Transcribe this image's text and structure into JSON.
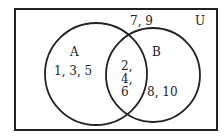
{
  "universe": {
    "label": "U",
    "outside_elements": "7, 9"
  },
  "sets": [
    {
      "name": "A",
      "only_elements": "1, 3, 5"
    },
    {
      "name": "B",
      "only_elements": "8, 10"
    }
  ],
  "intersection": {
    "line1": "2,",
    "line2": "4,",
    "line3": "6"
  },
  "colors": {
    "stroke": "#222222",
    "background": "#ffffff"
  }
}
